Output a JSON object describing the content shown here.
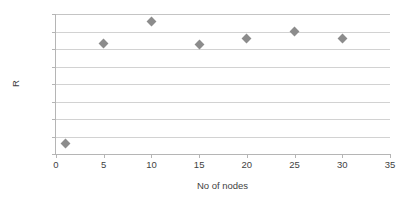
{
  "chart_data": {
    "type": "scatter",
    "title": "",
    "xlabel": "No of nodes",
    "ylabel": "R",
    "xlim": [
      0,
      35
    ],
    "ylim": [
      0.96,
      1
    ],
    "xticks": [
      "0",
      "5",
      "10",
      "15",
      "20",
      "25",
      "30",
      "35"
    ],
    "xtick_values": [
      0,
      5,
      10,
      15,
      20,
      25,
      30,
      35
    ],
    "yticks": [
      "0.96",
      "0.965",
      "0.97",
      "0.975",
      "0.98",
      "0.985",
      "0.99",
      "0.995",
      "1"
    ],
    "ytick_values": [
      0.96,
      0.965,
      0.97,
      0.975,
      0.98,
      0.985,
      0.99,
      0.995,
      1
    ],
    "grid": "horizontal",
    "legend": "none",
    "marker": "diamond",
    "marker_color": "#8c8c8c",
    "x": [
      1,
      5,
      10,
      15,
      20,
      25,
      30
    ],
    "values": [
      0.963,
      0.9915,
      0.998,
      0.9912,
      0.9929,
      0.9951,
      0.9929
    ],
    "series": [
      {
        "name": "R",
        "points": [
          {
            "x": 1,
            "y": 0.963
          },
          {
            "x": 5,
            "y": 0.9915
          },
          {
            "x": 10,
            "y": 0.998
          },
          {
            "x": 15,
            "y": 0.9912
          },
          {
            "x": 20,
            "y": 0.9929
          },
          {
            "x": 25,
            "y": 0.9951
          },
          {
            "x": 30,
            "y": 0.9929
          }
        ]
      }
    ],
    "colors": {
      "marker": "#8c8c8c",
      "gridline": "#d2d2d2",
      "axis": "#b5b5b5",
      "text": "#3f3f3f",
      "background": "#ffffff"
    }
  }
}
